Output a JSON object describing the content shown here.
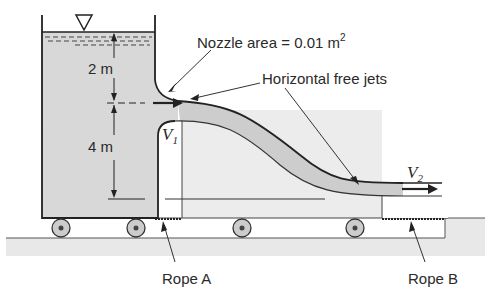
{
  "diagram": {
    "labels": {
      "nozzle_area_prefix": "Nozzle area = 0.01 m",
      "nozzle_area_exp": "2",
      "horizontal_free_jets": "Horizontal free jets",
      "height_upper": "2 m",
      "height_lower": "4 m",
      "v1_symbol": "V",
      "v1_sub": "1",
      "v2_symbol": "V",
      "v2_sub": "2",
      "rope_a": "Rope A",
      "rope_b": "Rope B"
    },
    "colors": {
      "water": "#d9d9d9",
      "jet": "#cfcfcf",
      "ground": "#e6e6e6",
      "line": "#2a2a2a",
      "cart_fill": "#ebebeb"
    }
  }
}
